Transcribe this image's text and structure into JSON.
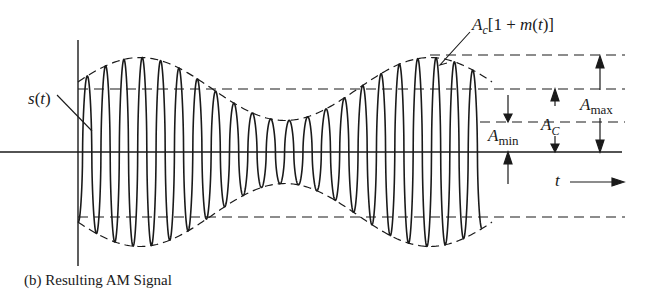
{
  "diagram": {
    "title": "Resulting AM Signal",
    "caption_prefix": "(b)",
    "caption": "(b)  Resulting AM Signal",
    "labels": {
      "signal": "s(t)",
      "envelope_A": "A",
      "envelope_sub": "c",
      "envelope_rest": "[1 + m(t)]",
      "amax_A": "A",
      "amax_sub": "max",
      "amin_A": "A",
      "amin_sub": "min",
      "ac_A": "A",
      "ac_sub": "C",
      "time": "t"
    },
    "signal_model": {
      "carrier_cycles": 22,
      "modulation_cycles": 1,
      "modulation_index": 0.5,
      "description": "Carrier amplitude-modulated by a sinusoidal message; envelope peaks at A_max, dips to A_min, mean level A_C"
    },
    "colors": {
      "ink": "#1a1a1a",
      "background": "#ffffff"
    }
  }
}
